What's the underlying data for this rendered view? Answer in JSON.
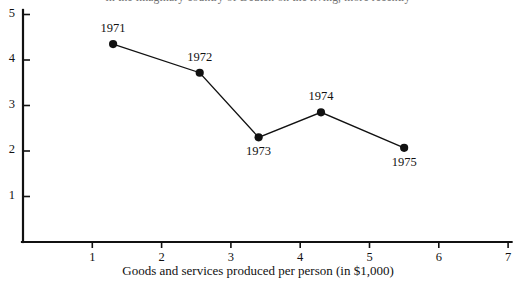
{
  "page": {
    "cut_caption": "in the imaginary country of Deuten on the living, more recently"
  },
  "chart_data": {
    "type": "line",
    "title": "",
    "subtitle": "",
    "xlabel": "Goods and services produced per person (in $1,000)",
    "ylabel": "",
    "xlim": [
      0,
      7
    ],
    "ylim": [
      0,
      5
    ],
    "xticks": [
      1,
      2,
      3,
      4,
      5,
      6,
      7
    ],
    "xtick_labels": [
      "1",
      "2",
      "3",
      "4",
      "5",
      "6",
      "7"
    ],
    "yticks": [
      1,
      2,
      3,
      4,
      5
    ],
    "ytick_labels": [
      "1",
      "2",
      "3",
      "4",
      "5"
    ],
    "grid": false,
    "legend": false,
    "marker": "filled-circle",
    "line_color": "#111111",
    "marker_color": "#111111",
    "points": [
      {
        "label": "1971",
        "x": 1.3,
        "y": 4.35,
        "label_pos": "above"
      },
      {
        "label": "1972",
        "x": 2.55,
        "y": 3.72,
        "label_pos": "above"
      },
      {
        "label": "1973",
        "x": 3.4,
        "y": 2.3,
        "label_pos": "below"
      },
      {
        "label": "1974",
        "x": 4.3,
        "y": 2.85,
        "label_pos": "above"
      },
      {
        "label": "1975",
        "x": 5.5,
        "y": 2.07,
        "label_pos": "below"
      }
    ]
  }
}
